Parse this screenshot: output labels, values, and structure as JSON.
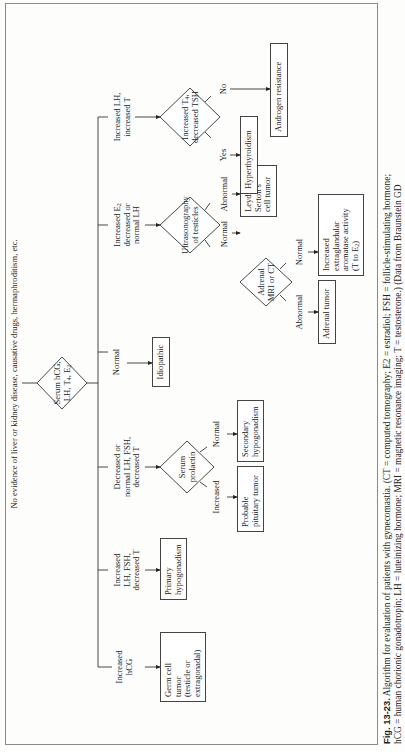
{
  "top_note": "No evidence of liver or kidney disease, causative drugs, hermaphroditism, etc.",
  "root": {
    "line1": "Serum hCG,",
    "line2": "LH, T",
    "sub1": "4",
    "line2b": ", E",
    "sub2": "2"
  },
  "branches": [
    {
      "label": [
        "Increased",
        "hCG"
      ]
    },
    {
      "label": [
        "Increased",
        "LH, FSH,",
        "decreased T"
      ]
    },
    {
      "label": [
        "Decreased or",
        "normal LH, FSH,",
        "decreased T"
      ]
    },
    {
      "label": [
        "Normal"
      ]
    },
    {
      "label": [
        "Increased E2",
        "decreased or",
        "normal LH"
      ]
    },
    {
      "label": [
        "Increased LH,",
        "increased T"
      ]
    }
  ],
  "nodes": {
    "germ_cell": [
      "Germ cell",
      "tumor",
      "(testicle or",
      "extragonadal)"
    ],
    "primary_hypo": [
      "Primary",
      "hypogonadism"
    ],
    "serum_prolactin": [
      "Serum",
      "prolactin"
    ],
    "prolactin_increased": "Increased",
    "prolactin_normal": "Normal",
    "pituitary": [
      "Probable",
      "pituitary tumor"
    ],
    "secondary_hypo": [
      "Secondary",
      "hypogonadism"
    ],
    "idiopathic": "Idiopathic",
    "ultrasonography": [
      "Ultrasonography",
      "of testicles"
    ],
    "us_normal": "Normal",
    "us_abnormal": "Abnormal",
    "leydig": [
      "Leydig's or",
      "Sertoli's",
      "cell tumor"
    ],
    "adrenal_test": [
      "Adrenal",
      "MRI or CT"
    ],
    "adrenal_abnormal": "Abnormal",
    "adrenal_normal": "Normal",
    "adrenal_tumor": "Adrenal tumor",
    "aromatase": [
      "Increased",
      "extraglandular",
      "aromatase activity",
      "(T to E2)"
    ],
    "t4_test": [
      "Increased T4,",
      "decreased TSH"
    ],
    "t4_yes": "Yes",
    "t4_no": "No",
    "hyperthyroidism": "Hyperthyroidism",
    "androgen": "Androgen resistance"
  },
  "caption": {
    "fig": "Fig. 13-23.",
    "line1": " Algorithm for evaluation of patients with gynecomastia. (CT = computed tomography; E2 = estradiol; FSH = follicle-stimulating hormone;",
    "line2": "hCG = human chorionic gonadotropin; LH = luteinizing hormone; MRI = magnetic resonance imaging; T = testosterone.) (Data from Braunstein GD"
  }
}
